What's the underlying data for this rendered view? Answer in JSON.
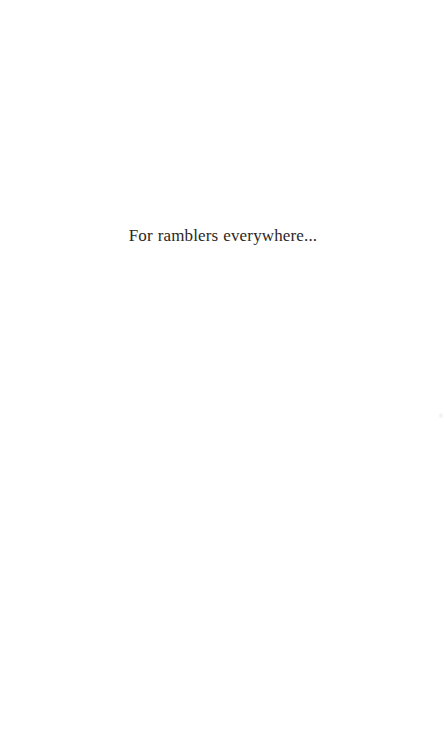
{
  "page": {
    "background_color": "#ffffff",
    "width": 446,
    "height": 747
  },
  "dedication": {
    "text": "For ramblers everywhere...",
    "text_color": "#2a2725"
  },
  "artifacts": {
    "scan_speck_color": "#f4f2f2"
  }
}
